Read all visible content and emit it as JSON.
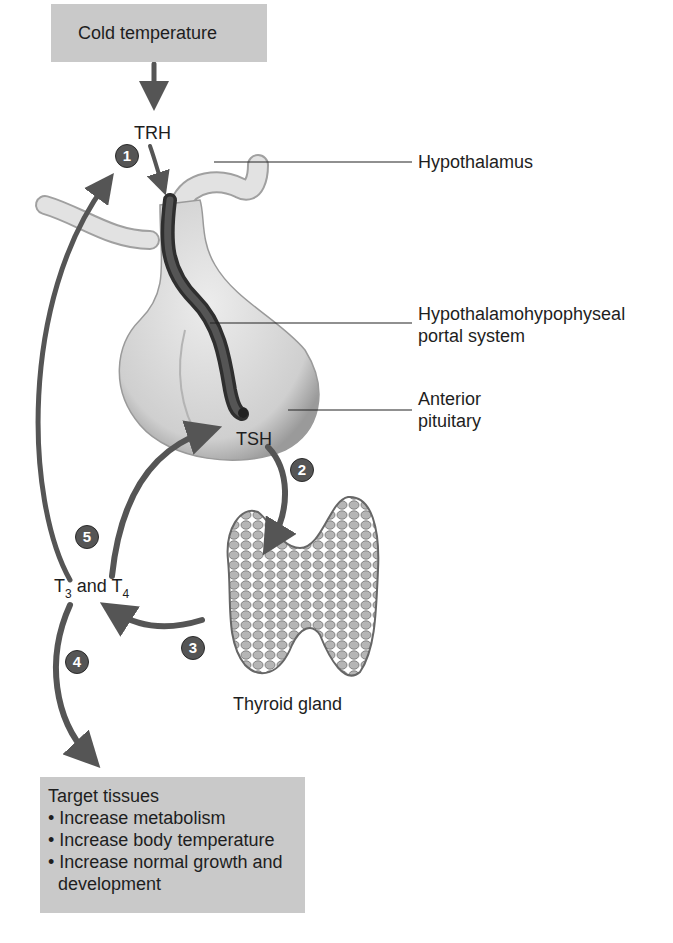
{
  "diagram": {
    "stimulus": "Cold temperature",
    "hormones": {
      "trh": "TRH",
      "tsh": "TSH",
      "t3_t4": {
        "t1": "T",
        "sub1": "3",
        "mid": " and T",
        "sub2": "4"
      }
    },
    "labels": {
      "hypothalamus": "Hypothalamus",
      "portal_line1": "Hypothalamohypophyseal",
      "portal_line2": "portal system",
      "anterior_line1": "Anterior",
      "anterior_line2": "pituitary",
      "thyroid": "Thyroid gland"
    },
    "steps": [
      "1",
      "2",
      "3",
      "4",
      "5"
    ],
    "target_box": {
      "title": "Target tissues",
      "bullets": [
        "• Increase metabolism",
        "• Increase body temperature",
        "• Increase normal growth and",
        "  development"
      ]
    },
    "colors": {
      "box_fill": "#c9c9c9",
      "arrow": "#555555",
      "gland": "#d8d8d8",
      "vessel": "#3a3a3a",
      "thyroid": "#8f8f8f"
    }
  }
}
